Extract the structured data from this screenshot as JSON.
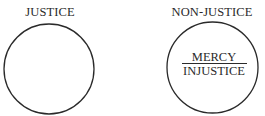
{
  "diagram": {
    "left": {
      "title": "JUSTICE"
    },
    "right": {
      "title": "NON-JUSTICE",
      "fraction": {
        "numerator": "MERCY",
        "denominator": "INJUSTICE"
      }
    },
    "colors": {
      "stroke": "#2a2a2a",
      "background": "#ffffff"
    }
  }
}
